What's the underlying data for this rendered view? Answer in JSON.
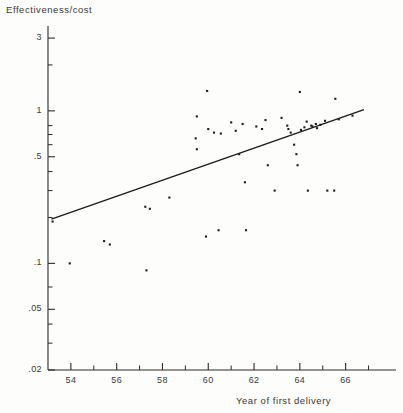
{
  "chart_data": {
    "type": "scatter",
    "title": "",
    "xlabel": "Year of first delivery",
    "ylabel": "Effectiveness/cost",
    "yscale": "log",
    "xscale": "linear",
    "xlim": [
      53.0,
      68.2
    ],
    "ylim": [
      0.02,
      3.6
    ],
    "grid": false,
    "legend": null,
    "xticks": [
      54,
      56,
      58,
      60,
      62,
      64,
      66
    ],
    "xtick_labels": [
      "54",
      "56",
      "58",
      "60",
      "62",
      "64",
      "66"
    ],
    "xminor_ticks": [
      55,
      57,
      59,
      61,
      63,
      65,
      67
    ],
    "yticks": [
      0.02,
      0.05,
      0.1,
      0.5,
      1,
      3
    ],
    "ytick_labels": [
      ".02",
      ".05",
      ".1",
      ".5",
      "1",
      "3"
    ],
    "yminor_ticks": [
      0.03,
      0.04,
      0.07,
      0.2,
      0.3,
      0.4,
      0.6,
      0.7,
      0.8,
      2
    ],
    "marker": "square-dot",
    "marker_color": "#1c1c1c",
    "marker_size": 2.1,
    "points": [
      {
        "x": 53.95,
        "y": 0.1
      },
      {
        "x": 53.2,
        "y": 0.188
      },
      {
        "x": 55.45,
        "y": 0.14
      },
      {
        "x": 55.7,
        "y": 0.133
      },
      {
        "x": 57.3,
        "y": 0.09
      },
      {
        "x": 57.25,
        "y": 0.235
      },
      {
        "x": 57.45,
        "y": 0.228
      },
      {
        "x": 58.3,
        "y": 0.27
      },
      {
        "x": 59.9,
        "y": 0.15
      },
      {
        "x": 59.95,
        "y": 1.35
      },
      {
        "x": 59.5,
        "y": 0.92
      },
      {
        "x": 59.45,
        "y": 0.66
      },
      {
        "x": 59.5,
        "y": 0.56
      },
      {
        "x": 60.0,
        "y": 0.76
      },
      {
        "x": 60.25,
        "y": 0.72
      },
      {
        "x": 60.55,
        "y": 0.71
      },
      {
        "x": 60.45,
        "y": 0.165
      },
      {
        "x": 61.0,
        "y": 0.84
      },
      {
        "x": 61.2,
        "y": 0.74
      },
      {
        "x": 61.35,
        "y": 0.52
      },
      {
        "x": 61.5,
        "y": 0.82
      },
      {
        "x": 61.6,
        "y": 0.34
      },
      {
        "x": 61.65,
        "y": 0.165
      },
      {
        "x": 62.1,
        "y": 0.79
      },
      {
        "x": 62.35,
        "y": 0.76
      },
      {
        "x": 62.5,
        "y": 0.87
      },
      {
        "x": 62.6,
        "y": 0.44
      },
      {
        "x": 62.9,
        "y": 0.3
      },
      {
        "x": 63.2,
        "y": 0.9
      },
      {
        "x": 63.45,
        "y": 0.8
      },
      {
        "x": 63.5,
        "y": 0.76
      },
      {
        "x": 63.6,
        "y": 0.72
      },
      {
        "x": 63.75,
        "y": 0.6
      },
      {
        "x": 63.85,
        "y": 0.52
      },
      {
        "x": 63.9,
        "y": 0.44
      },
      {
        "x": 64.0,
        "y": 1.33
      },
      {
        "x": 64.05,
        "y": 0.75
      },
      {
        "x": 64.2,
        "y": 0.78
      },
      {
        "x": 64.3,
        "y": 0.85
      },
      {
        "x": 64.35,
        "y": 0.3
      },
      {
        "x": 64.5,
        "y": 0.8
      },
      {
        "x": 64.55,
        "y": 0.79
      },
      {
        "x": 64.7,
        "y": 0.82
      },
      {
        "x": 64.75,
        "y": 0.77
      },
      {
        "x": 64.9,
        "y": 0.81
      },
      {
        "x": 65.1,
        "y": 0.86
      },
      {
        "x": 65.2,
        "y": 0.3
      },
      {
        "x": 65.5,
        "y": 0.3
      },
      {
        "x": 65.55,
        "y": 1.2
      },
      {
        "x": 65.7,
        "y": 0.88
      },
      {
        "x": 66.3,
        "y": 0.93
      }
    ],
    "fit_line": {
      "label": "regression line",
      "color": "#1c1c1c",
      "x_start": 53.15,
      "y_start": 0.195,
      "x_end": 66.8,
      "y_end": 1.02
    }
  }
}
